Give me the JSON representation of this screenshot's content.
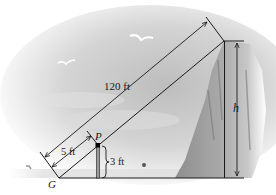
{
  "diagram": {
    "labels": {
      "hypotenuse": "120 ft",
      "short_distance": "5 ft",
      "post_height": "3 ft",
      "point_p": "P",
      "point_g": "G",
      "height": "h"
    },
    "colors": {
      "line": "#1a1a1a",
      "sky_light": "#ffffff",
      "sky_gray": "#c9c9c9",
      "cliff": "#a8a8a8",
      "water": "#e2e2e2"
    },
    "elements": {
      "birds": 2,
      "swimmers": 2
    }
  }
}
